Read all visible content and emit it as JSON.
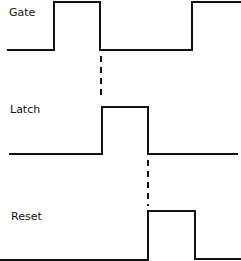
{
  "diagram": {
    "type": "timing-diagram",
    "signals": [
      {
        "name": "Gate",
        "label_pos": [
          9,
          8
        ]
      },
      {
        "name": "Latch",
        "label_pos": [
          10,
          105
        ]
      },
      {
        "name": "Reset",
        "label_pos": [
          11,
          212
        ]
      }
    ],
    "colors": {
      "line": "#111111",
      "background": "#ffffff"
    }
  }
}
